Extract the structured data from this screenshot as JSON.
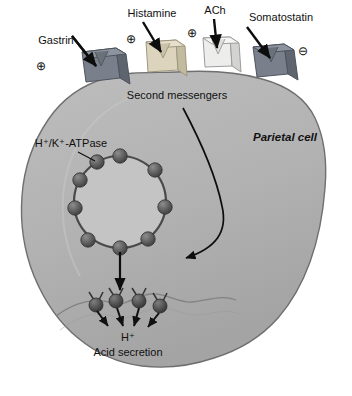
{
  "figure": {
    "background_color": "#ffffff",
    "cell": {
      "name_label": "Parietal cell",
      "fill_color": "#b0b0b0",
      "stroke_color": "#6b6b6b"
    },
    "second_messengers_label": "Second messengers",
    "pump_label": "H⁺/K⁺-ATPase",
    "proton_label": "H⁺",
    "acid_secretion_label": "Acid secretion",
    "receptors": [
      {
        "id": "gastrin",
        "label": "Gastrin",
        "sign": "⊕",
        "sign_meaning": "stimulatory",
        "color": "#7d8490",
        "x": 97,
        "y": 68
      },
      {
        "id": "histamine",
        "label": "Histamine",
        "sign": "⊕",
        "sign_meaning": "stimulatory",
        "color": "#d8cfb8",
        "x": 160,
        "y": 56
      },
      {
        "id": "ach",
        "label": "ACh",
        "sign": "⊕",
        "sign_meaning": "stimulatory",
        "color": "#e8e8e6",
        "x": 215,
        "y": 52
      },
      {
        "id": "somatostatin",
        "label": "Somatostatin",
        "sign": "⊖",
        "sign_meaning": "inhibitory",
        "color": "#7d8490",
        "x": 270,
        "y": 62
      }
    ],
    "vesicle": {
      "pump_count": 9,
      "fill_color": "#c2c2c2",
      "bead_color": "#5a5a5a"
    },
    "secretion": {
      "pump_count": 4,
      "bead_color": "#4f4f4f"
    }
  }
}
